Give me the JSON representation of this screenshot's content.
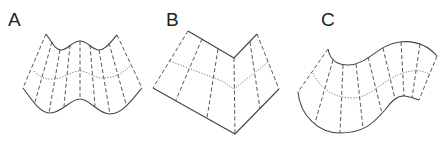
{
  "figure": {
    "panels": [
      {
        "label": "A",
        "description": "saddle-like wavy surface with rulings"
      },
      {
        "label": "B",
        "description": "folded bent planar surface with rulings"
      },
      {
        "label": "C",
        "description": "curved S-shaped surface with rulings"
      }
    ],
    "colors": {
      "stroke": "#444444",
      "background": "#ffffff"
    }
  }
}
